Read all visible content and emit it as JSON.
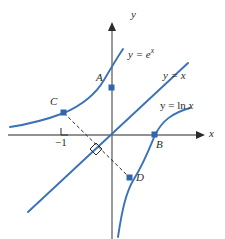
{
  "figure": {
    "colors": {
      "curve": "#3a72b8",
      "axis": "#6e6e6e",
      "dash": "#2b2b2b",
      "point": "#2f67ad",
      "text": "#2b2b2b",
      "background": "#ffffff"
    },
    "axes": {
      "x_label": "x",
      "y_label": "y",
      "origin": [
        112,
        135
      ],
      "x_range_px": [
        8,
        200
      ],
      "y_range_px": [
        22,
        239
      ]
    },
    "ticks": [
      {
        "label": "−1",
        "axis": "x",
        "value": -1,
        "px": [
          66,
          143
        ]
      }
    ],
    "curve_labels": [
      {
        "name": "exponential",
        "prefix": "y = e",
        "exponent": "x",
        "px": [
          128,
          52
        ]
      },
      {
        "name": "identity",
        "text": "y = x",
        "px": [
          163,
          74
        ]
      },
      {
        "name": "logarithm",
        "prefix": "y = ln ",
        "arg": "x",
        "px": [
          166,
          105
        ]
      }
    ],
    "points": [
      {
        "name": "A",
        "label": "A",
        "px": [
          112,
          88
        ],
        "label_px": [
          98,
          77
        ],
        "on": "y-axis"
      },
      {
        "name": "B",
        "label": "B",
        "px": [
          155,
          135
        ],
        "label_px": [
          157,
          139
        ],
        "on": "x-axis"
      },
      {
        "name": "C",
        "label": "C",
        "px": [
          64,
          113
        ],
        "label_px": [
          52,
          101
        ],
        "on": "exponential"
      },
      {
        "name": "D",
        "label": "D",
        "px": [
          130,
          178
        ],
        "label_px": [
          134,
          174
        ],
        "on": "logarithm"
      }
    ],
    "annotations": [
      {
        "name": "right-angle-at-x-axis",
        "type": "square",
        "px": [
          61,
          130
        ]
      },
      {
        "name": "right-angle-on-identity-line",
        "type": "square-rotated",
        "px": [
          95,
          149
        ]
      },
      {
        "name": "segment-C-to-D",
        "type": "dashed-line",
        "from": [
          64,
          113
        ],
        "to": [
          130,
          178
        ]
      }
    ]
  }
}
